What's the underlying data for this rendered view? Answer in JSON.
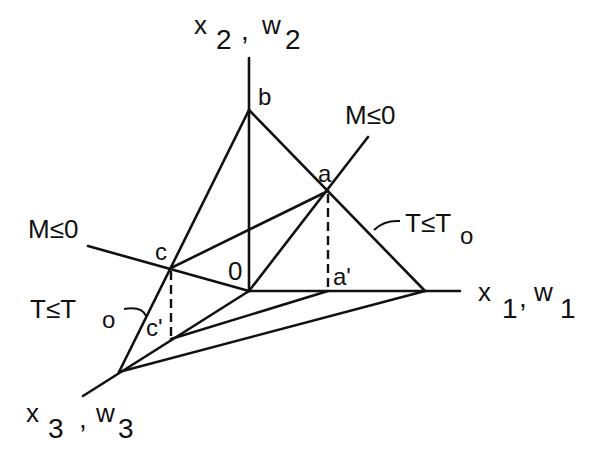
{
  "figure": {
    "axes": {
      "x1": {
        "label": "x",
        "sub": "1",
        "label2": "w",
        "sub2": "1"
      },
      "x2": {
        "label": "x",
        "sub": "2",
        "label2": "w",
        "sub2": "2"
      },
      "x3": {
        "label": "x",
        "sub": "3",
        "label2": "w",
        "sub2": "3"
      }
    },
    "points": {
      "origin": "0",
      "a": "a",
      "b": "b",
      "c": "c",
      "a_prime": "a'",
      "c_prime": "c'"
    },
    "constraints": {
      "m_upper": {
        "text": "M≤0"
      },
      "m_left": {
        "text": "M≤0"
      },
      "t_right": {
        "text": "T≤T",
        "sub": "o"
      },
      "t_left": {
        "text": "T≤T",
        "sub": "o"
      }
    },
    "colors": {
      "line": "#111111",
      "background": "#ffffff"
    }
  }
}
